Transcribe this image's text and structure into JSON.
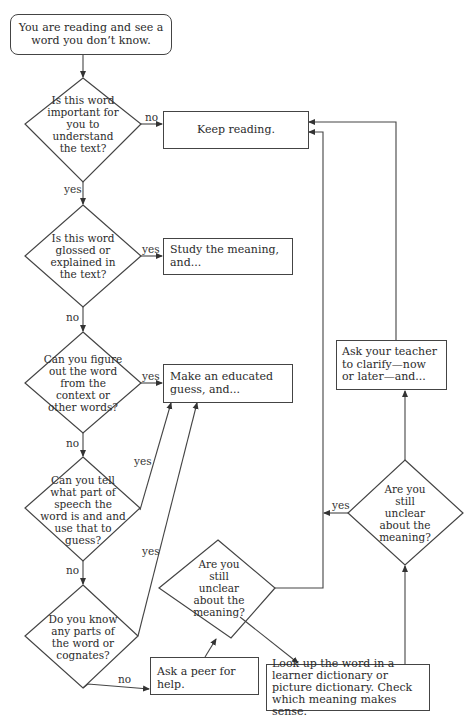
{
  "flowchart": {
    "start": "You are reading and see a word you don’t know.",
    "decisions": {
      "important": "Is this word important for you to understand the text?",
      "glossed": "Is this word glossed or explained in the text?",
      "context": "Can you figure out the word from the context or other words?",
      "part_of_speech": "Can you tell what part of speech the word is and and use that to guess?",
      "cognates": "Do you know any parts of the word or cognates?",
      "unclear_after_peer": "Are you still unclear about the meaning?",
      "unclear_after_dictionary": "Are you still unclear about the meaning?"
    },
    "actions": {
      "keep_reading": "Keep reading.",
      "study": "Study the meaning, and...",
      "guess": "Make an educated guess, and...",
      "peer": "Ask a peer for help.",
      "dictionary": "Look up the word in a learner dictionary or picture dictionary. Check which meaning makes sense.",
      "teacher": "Ask your teacher to clarify—now or later—and..."
    },
    "edge_labels": {
      "important_no": "no",
      "important_yes": "yes",
      "glossed_yes": "yes",
      "glossed_no": "no",
      "context_yes": "yes",
      "context_no": "no",
      "pos_yes": "yes",
      "pos_no": "no",
      "cognates_yes": "yes",
      "cognates_no": "no",
      "dictionary_unclear_yes": "yes"
    }
  }
}
